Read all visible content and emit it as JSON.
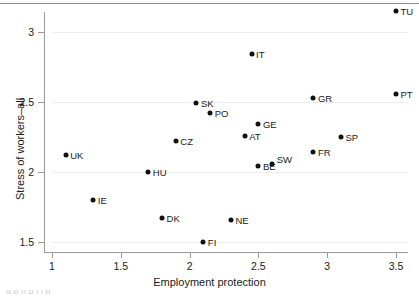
{
  "figure": {
    "top_rule": true,
    "cropped_caption_below": "a b  h d   f         l          d"
  },
  "chart_data": {
    "type": "scatter",
    "title": "",
    "xlabel": "Employment protection",
    "ylabel": "Stress of workers–all",
    "xlim": [
      1,
      3.5
    ],
    "ylim": [
      1.45,
      3.2
    ],
    "xticks": [
      "1",
      "1.5",
      "2",
      "2.5",
      "3",
      "3.5"
    ],
    "xtick_values": [
      1,
      1.5,
      2,
      2.5,
      3,
      3.5
    ],
    "yticks": [
      "1.5",
      "2",
      "2.5",
      "3"
    ],
    "ytick_values": [
      1.5,
      2,
      2.5,
      3
    ],
    "grid": "horizontal",
    "legend": "none",
    "marker_color": "#111111",
    "grid_color": "#ededed",
    "axis_color": "#9a9a9a",
    "points": [
      {
        "label": "UK",
        "x": 1.1,
        "y": 2.12,
        "label_side": "right"
      },
      {
        "label": "IE",
        "x": 1.3,
        "y": 1.8,
        "label_side": "right"
      },
      {
        "label": "HU",
        "x": 1.7,
        "y": 2.0,
        "label_side": "right"
      },
      {
        "label": "DK",
        "x": 1.8,
        "y": 1.67,
        "label_side": "right"
      },
      {
        "label": "CZ",
        "x": 1.9,
        "y": 2.22,
        "label_side": "right"
      },
      {
        "label": "SK",
        "x": 2.05,
        "y": 2.49,
        "label_side": "right"
      },
      {
        "label": "FI",
        "x": 2.1,
        "y": 1.5,
        "label_side": "right"
      },
      {
        "label": "PO",
        "x": 2.15,
        "y": 2.42,
        "label_side": "right"
      },
      {
        "label": "NE",
        "x": 2.3,
        "y": 1.66,
        "label_side": "right"
      },
      {
        "label": "AT",
        "x": 2.4,
        "y": 2.26,
        "label_side": "right"
      },
      {
        "label": "IT",
        "x": 2.45,
        "y": 2.84,
        "label_side": "right"
      },
      {
        "label": "GE",
        "x": 2.5,
        "y": 2.34,
        "label_side": "right"
      },
      {
        "label": "BE",
        "x": 2.5,
        "y": 2.04,
        "label_side": "right"
      },
      {
        "label": "SW",
        "x": 2.6,
        "y": 2.06,
        "label_side": "right"
      },
      {
        "label": "GR",
        "x": 2.9,
        "y": 2.53,
        "label_side": "right"
      },
      {
        "label": "FR",
        "x": 2.9,
        "y": 2.14,
        "label_side": "right"
      },
      {
        "label": "SP",
        "x": 3.1,
        "y": 2.25,
        "label_side": "right"
      },
      {
        "label": "PT",
        "x": 3.5,
        "y": 2.56,
        "label_side": "right"
      },
      {
        "label": "TU",
        "x": 3.5,
        "y": 3.15,
        "label_side": "right"
      }
    ]
  }
}
